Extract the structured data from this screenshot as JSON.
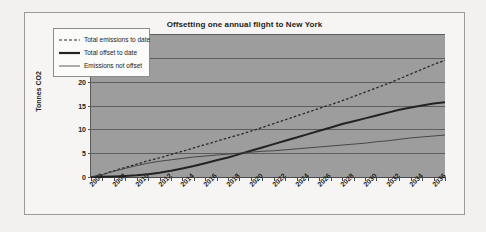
{
  "chart_data": {
    "type": "line",
    "title": "Offsetting one annual flight to New York",
    "xlabel": "",
    "ylabel": "Tonnes CO2",
    "ylim": [
      0,
      30
    ],
    "yticks": [
      0,
      5,
      10,
      15,
      20,
      25,
      30
    ],
    "xlim": [
      2006,
      2037
    ],
    "xticks": [
      2006,
      2008,
      2010,
      2012,
      2014,
      2016,
      2018,
      2020,
      2022,
      2024,
      2026,
      2028,
      2030,
      2032,
      2034,
      2036
    ],
    "x": [
      2006,
      2007,
      2008,
      2009,
      2010,
      2011,
      2012,
      2013,
      2014,
      2015,
      2016,
      2017,
      2018,
      2019,
      2020,
      2021,
      2022,
      2023,
      2024,
      2025,
      2026,
      2027,
      2028,
      2029,
      2030,
      2031,
      2032,
      2033,
      2034,
      2035,
      2036,
      2037
    ],
    "grid": true,
    "legend_position": "upper-left",
    "series": [
      {
        "name": "Total emissions to date",
        "style": "dashed",
        "color": "#2a2a2a",
        "values": [
          0.0,
          0.5,
          1.3,
          2.0,
          2.7,
          3.4,
          4.0,
          4.7,
          5.4,
          6.1,
          6.8,
          7.5,
          8.2,
          8.9,
          9.6,
          10.4,
          11.2,
          12.0,
          12.8,
          13.6,
          14.4,
          15.2,
          16.0,
          16.9,
          17.8,
          18.7,
          19.6,
          20.6,
          21.6,
          22.6,
          23.6,
          24.5
        ]
      },
      {
        "name": "Total offset to date",
        "style": "solid-thick",
        "color": "#232323",
        "values": [
          0.0,
          0.05,
          0.1,
          0.2,
          0.35,
          0.6,
          0.9,
          1.3,
          1.8,
          2.3,
          2.9,
          3.5,
          4.1,
          4.8,
          5.5,
          6.2,
          6.9,
          7.6,
          8.3,
          9.0,
          9.7,
          10.4,
          11.1,
          11.7,
          12.3,
          12.9,
          13.5,
          14.1,
          14.6,
          15.0,
          15.4,
          15.7
        ]
      },
      {
        "name": "Emissions not offset",
        "style": "solid-thin",
        "color": "#3d3d3d",
        "values": [
          0.0,
          0.5,
          1.2,
          1.8,
          2.4,
          2.9,
          3.3,
          3.6,
          3.9,
          4.2,
          4.4,
          4.6,
          4.8,
          5.0,
          5.2,
          5.4,
          5.5,
          5.7,
          5.9,
          6.1,
          6.3,
          6.5,
          6.7,
          6.9,
          7.1,
          7.4,
          7.6,
          7.9,
          8.2,
          8.4,
          8.6,
          8.8
        ]
      }
    ]
  },
  "figure": {
    "title": "Offsetting one annual flight to New York",
    "ylabel": "Tonnes CO2"
  },
  "legend": {
    "items": [
      {
        "label": "Total emissions to date"
      },
      {
        "label": "Total offset to date"
      },
      {
        "label": "Emissions not offset"
      }
    ]
  }
}
